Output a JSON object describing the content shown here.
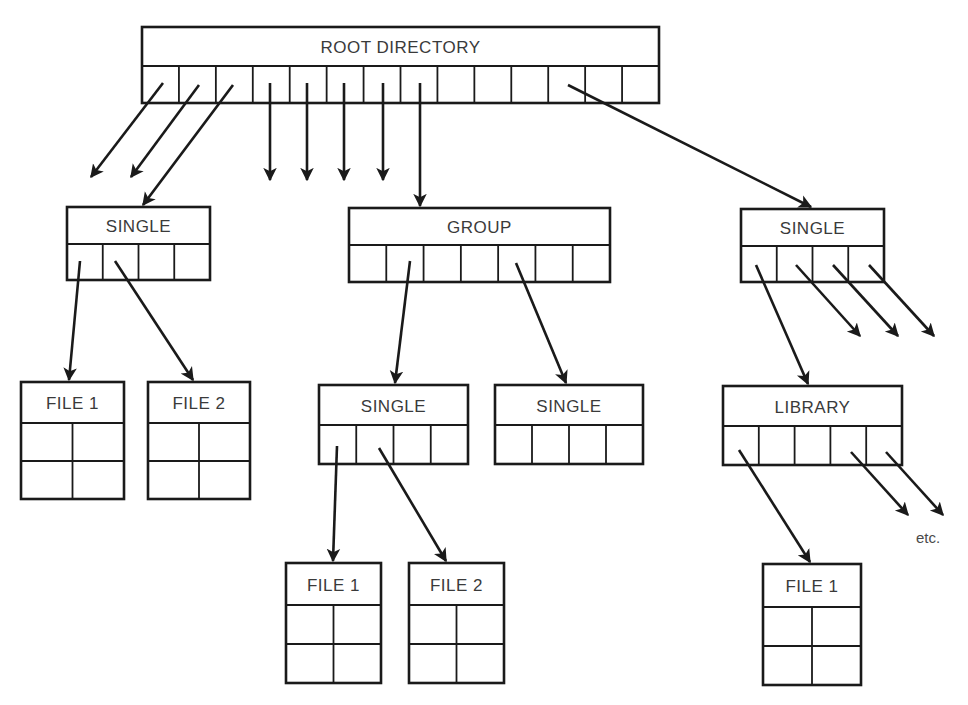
{
  "diagram": {
    "type": "hierarchical directory structure",
    "colors": {
      "line": "#1a1a1a",
      "text": "#3a3a3a",
      "background": "#ffffff"
    },
    "note": "etc.",
    "boxes": [
      {
        "id": "root",
        "label": "ROOT DIRECTORY",
        "kind": "directory",
        "x": 142,
        "y": 27,
        "w": 517,
        "h": 76,
        "titleH": 39,
        "cells": 14,
        "rows": 1
      },
      {
        "id": "single-a",
        "label": "SINGLE",
        "kind": "directory",
        "x": 67,
        "y": 207,
        "w": 143,
        "h": 73,
        "titleH": 37,
        "cells": 4,
        "rows": 1
      },
      {
        "id": "group",
        "label": "GROUP",
        "kind": "directory",
        "x": 349,
        "y": 208,
        "w": 261,
        "h": 74,
        "titleH": 37,
        "cells": 7,
        "rows": 1
      },
      {
        "id": "single-b",
        "label": "SINGLE",
        "kind": "directory",
        "x": 741,
        "y": 209,
        "w": 143,
        "h": 73,
        "titleH": 37,
        "cells": 4,
        "rows": 1
      },
      {
        "id": "file-a1",
        "label": "FILE 1",
        "kind": "file",
        "x": 21,
        "y": 382,
        "w": 103,
        "h": 117,
        "titleH": 41,
        "cells": 2,
        "rows": 2
      },
      {
        "id": "file-a2",
        "label": "FILE 2",
        "kind": "file",
        "x": 148,
        "y": 382,
        "w": 102,
        "h": 117,
        "titleH": 41,
        "cells": 2,
        "rows": 2
      },
      {
        "id": "single-c",
        "label": "SINGLE",
        "kind": "directory",
        "x": 319,
        "y": 385,
        "w": 149,
        "h": 79,
        "titleH": 40,
        "cells": 4,
        "rows": 1
      },
      {
        "id": "single-d",
        "label": "SINGLE",
        "kind": "directory",
        "x": 495,
        "y": 385,
        "w": 148,
        "h": 79,
        "titleH": 40,
        "cells": 4,
        "rows": 1
      },
      {
        "id": "library",
        "label": "LIBRARY",
        "kind": "directory",
        "x": 723,
        "y": 386,
        "w": 179,
        "h": 79,
        "titleH": 40,
        "cells": 5,
        "rows": 1
      },
      {
        "id": "file-c1",
        "label": "FILE 1",
        "kind": "file",
        "x": 286,
        "y": 563,
        "w": 95,
        "h": 120,
        "titleH": 42,
        "cells": 2,
        "rows": 2
      },
      {
        "id": "file-c2",
        "label": "FILE 2",
        "kind": "file",
        "x": 409,
        "y": 563,
        "w": 95,
        "h": 120,
        "titleH": 42,
        "cells": 2,
        "rows": 2
      },
      {
        "id": "file-l1",
        "label": "FILE 1",
        "kind": "file",
        "x": 763,
        "y": 564,
        "w": 98,
        "h": 121,
        "titleH": 43,
        "cells": 2,
        "rows": 2
      }
    ],
    "arrows": [
      {
        "from": "root",
        "to": null,
        "x1": 163,
        "y1": 83,
        "x2": 91,
        "y2": 177
      },
      {
        "from": "root",
        "to": null,
        "x1": 199,
        "y1": 85,
        "x2": 131,
        "y2": 177
      },
      {
        "from": "root",
        "to": "single-a",
        "x1": 233,
        "y1": 85,
        "x2": 143,
        "y2": 205
      },
      {
        "from": "root",
        "to": null,
        "x1": 270,
        "y1": 83,
        "x2": 270,
        "y2": 180
      },
      {
        "from": "root",
        "to": null,
        "x1": 307,
        "y1": 83,
        "x2": 307,
        "y2": 180
      },
      {
        "from": "root",
        "to": null,
        "x1": 344,
        "y1": 83,
        "x2": 344,
        "y2": 180
      },
      {
        "from": "root",
        "to": null,
        "x1": 383,
        "y1": 83,
        "x2": 383,
        "y2": 180
      },
      {
        "from": "root",
        "to": "group",
        "x1": 420,
        "y1": 83,
        "x2": 420,
        "y2": 206
      },
      {
        "from": "root",
        "to": "single-b",
        "x1": 568,
        "y1": 85,
        "x2": 811,
        "y2": 207
      },
      {
        "from": "single-a",
        "to": "file-a1",
        "x1": 80,
        "y1": 261,
        "x2": 69,
        "y2": 380
      },
      {
        "from": "single-a",
        "to": "file-a2",
        "x1": 115,
        "y1": 261,
        "x2": 193,
        "y2": 380
      },
      {
        "from": "group",
        "to": "single-c",
        "x1": 410,
        "y1": 261,
        "x2": 395,
        "y2": 383
      },
      {
        "from": "group",
        "to": "single-d",
        "x1": 516,
        "y1": 263,
        "x2": 566,
        "y2": 383
      },
      {
        "from": "single-b",
        "to": "library",
        "x1": 756,
        "y1": 265,
        "x2": 808,
        "y2": 384
      },
      {
        "from": "single-b",
        "to": null,
        "x1": 796,
        "y1": 265,
        "x2": 860,
        "y2": 336
      },
      {
        "from": "single-b",
        "to": null,
        "x1": 833,
        "y1": 265,
        "x2": 898,
        "y2": 336
      },
      {
        "from": "single-b",
        "to": null,
        "x1": 869,
        "y1": 265,
        "x2": 934,
        "y2": 336
      },
      {
        "from": "single-c",
        "to": "file-c1",
        "x1": 337,
        "y1": 446,
        "x2": 333,
        "y2": 561
      },
      {
        "from": "single-c",
        "to": "file-c2",
        "x1": 379,
        "y1": 448,
        "x2": 446,
        "y2": 561
      },
      {
        "from": "library",
        "to": "file-l1",
        "x1": 739,
        "y1": 450,
        "x2": 810,
        "y2": 562
      },
      {
        "from": "library",
        "to": null,
        "x1": 851,
        "y1": 452,
        "x2": 908,
        "y2": 515
      },
      {
        "from": "library",
        "to": null,
        "x1": 886,
        "y1": 452,
        "x2": 943,
        "y2": 515
      }
    ],
    "note_position": {
      "x": 916,
      "y": 543
    }
  }
}
